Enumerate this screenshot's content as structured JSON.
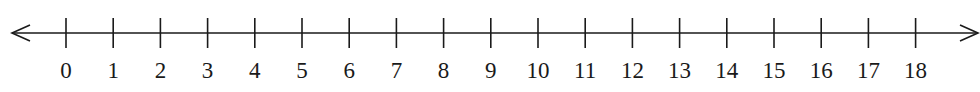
{
  "chart_data": {
    "type": "number_line",
    "title": "",
    "min": 0,
    "max": 18,
    "step": 1,
    "ticks": [
      0,
      1,
      2,
      3,
      4,
      5,
      6,
      7,
      8,
      9,
      10,
      11,
      12,
      13,
      14,
      15,
      16,
      17,
      18
    ],
    "tick_labels": [
      "0",
      "1",
      "2",
      "3",
      "4",
      "5",
      "6",
      "7",
      "8",
      "9",
      "10",
      "11",
      "12",
      "13",
      "14",
      "15",
      "16",
      "17",
      "18"
    ],
    "arrows": {
      "left": true,
      "right": true
    },
    "grid": false
  },
  "layout": {
    "line_y": 33,
    "line_x_start": 12,
    "line_x_end": 978,
    "first_tick_x": 66,
    "tick_spacing": 47.2,
    "tick_top": 18,
    "tick_bottom": 48,
    "label_baseline": 78,
    "color": "#1a1a1a"
  }
}
